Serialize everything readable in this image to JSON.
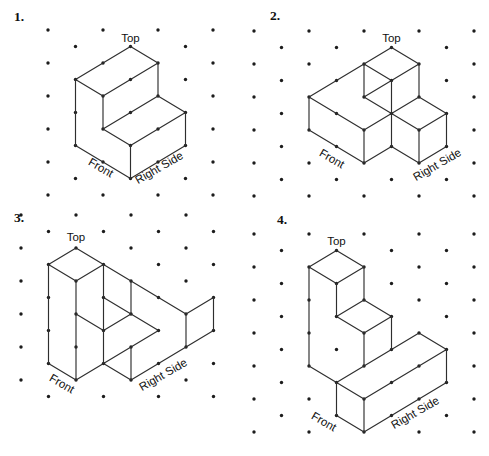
{
  "canvas": {
    "width": 489,
    "height": 456,
    "background": "#ffffff"
  },
  "style": {
    "unit_x": 27.5,
    "unit_y": 16.5,
    "line_color": "#2e2e2e",
    "line_width": 1.15,
    "dot_color": "#1c1c1c",
    "dot_radius": 1.7,
    "label_color": "#111111",
    "label_font_size": 11.5,
    "number_font_size": 13.5
  },
  "figures": [
    {
      "number": "1.",
      "number_pos": [
        14,
        21
      ],
      "origin": [
        48,
        30
      ],
      "grid_cols": 6,
      "grid_rows": 10,
      "edges": [
        [
          1,
          3,
          3,
          1
        ],
        [
          3,
          1,
          4,
          2
        ],
        [
          4,
          2,
          2,
          4
        ],
        [
          2,
          4,
          1,
          3
        ],
        [
          4,
          2,
          4,
          4
        ],
        [
          2,
          4,
          2,
          6
        ],
        [
          1,
          3,
          1,
          7
        ],
        [
          4,
          4,
          2,
          6
        ],
        [
          4,
          4,
          5,
          5
        ],
        [
          2,
          6,
          3,
          7
        ],
        [
          3,
          7,
          5,
          5
        ],
        [
          5,
          5,
          5,
          7
        ],
        [
          3,
          7,
          3,
          9
        ],
        [
          5,
          7,
          3,
          9
        ],
        [
          3,
          9,
          1,
          7
        ]
      ],
      "labels": [
        {
          "name": "top",
          "text": "Top",
          "pos": [
            130.5,
            42
          ],
          "rotate": 0
        },
        {
          "name": "front",
          "text": "Front",
          "pos": [
            99,
            171
          ],
          "rotate": 30
        },
        {
          "name": "right-side",
          "text": "Right Side",
          "pos": [
            161,
            171
          ],
          "rotate": -30
        }
      ]
    },
    {
      "number": "2.",
      "number_pos": [
        270,
        20
      ],
      "origin": [
        254,
        31
      ],
      "grid_cols": 8,
      "grid_rows": 10,
      "edges": [
        [
          4,
          2,
          5,
          1
        ],
        [
          5,
          1,
          6,
          2
        ],
        [
          6,
          2,
          5,
          3
        ],
        [
          5,
          3,
          4,
          2
        ],
        [
          4,
          2,
          4,
          4
        ],
        [
          6,
          2,
          6,
          4
        ],
        [
          5,
          3,
          5,
          7
        ],
        [
          4,
          4,
          5,
          5
        ],
        [
          5,
          5,
          6,
          4
        ],
        [
          5,
          3,
          4,
          4
        ],
        [
          2,
          4,
          4,
          2
        ],
        [
          2,
          4,
          4,
          6
        ],
        [
          4,
          6,
          5,
          5
        ],
        [
          2,
          4,
          2,
          6
        ],
        [
          4,
          6,
          4,
          8
        ],
        [
          2,
          6,
          4,
          8
        ],
        [
          4,
          8,
          5,
          7
        ],
        [
          6,
          4,
          7,
          5
        ],
        [
          7,
          5,
          6,
          6
        ],
        [
          6,
          6,
          5,
          5
        ],
        [
          7,
          5,
          7,
          7
        ],
        [
          6,
          6,
          6,
          8
        ],
        [
          5,
          7,
          6,
          8
        ],
        [
          6,
          8,
          7,
          7
        ]
      ],
      "labels": [
        {
          "name": "top",
          "text": "Top",
          "pos": [
            391.5,
            42
          ],
          "rotate": 0
        },
        {
          "name": "front",
          "text": "Front",
          "pos": [
            330,
            162
          ],
          "rotate": 30
        },
        {
          "name": "right-side",
          "text": "Right Side",
          "pos": [
            439,
            168
          ],
          "rotate": -30
        }
      ]
    },
    {
      "number": "3.",
      "number_pos": [
        14,
        222
      ],
      "origin": [
        21,
        215
      ],
      "grid_cols": 7,
      "grid_rows": 11,
      "edges": [
        [
          1,
          3,
          2,
          2
        ],
        [
          2,
          2,
          3,
          3
        ],
        [
          3,
          3,
          2,
          4
        ],
        [
          2,
          4,
          1,
          3
        ],
        [
          3,
          3,
          6,
          6
        ],
        [
          1,
          3,
          1,
          9
        ],
        [
          2,
          4,
          2,
          10
        ],
        [
          3,
          3,
          3,
          9
        ],
        [
          2,
          6,
          3,
          7
        ],
        [
          3,
          5,
          5,
          7
        ],
        [
          3,
          7,
          4,
          6
        ],
        [
          4,
          4,
          4,
          6
        ],
        [
          2,
          10,
          5,
          7
        ],
        [
          4,
          8,
          4,
          10
        ],
        [
          1,
          9,
          2,
          10
        ],
        [
          3,
          9,
          4,
          10
        ],
        [
          4,
          10,
          6,
          8
        ],
        [
          6,
          6,
          6,
          8
        ],
        [
          6,
          6,
          7,
          5
        ],
        [
          7,
          5,
          7,
          7
        ],
        [
          6,
          8,
          7,
          7
        ]
      ],
      "labels": [
        {
          "name": "top",
          "text": "Top",
          "pos": [
            76,
            241
          ],
          "rotate": 0
        },
        {
          "name": "front",
          "text": "Front",
          "pos": [
            60,
            387
          ],
          "rotate": 30
        },
        {
          "name": "right-side",
          "text": "Right Side",
          "pos": [
            165,
            378
          ],
          "rotate": -30
        }
      ]
    },
    {
      "number": "4.",
      "number_pos": [
        277,
        224
      ],
      "origin": [
        254,
        234
      ],
      "grid_cols": 8,
      "grid_rows": 12,
      "edges": [
        [
          2,
          2,
          3,
          1
        ],
        [
          3,
          1,
          4,
          2
        ],
        [
          4,
          2,
          3,
          3
        ],
        [
          3,
          3,
          2,
          2
        ],
        [
          2,
          2,
          2,
          8
        ],
        [
          3,
          3,
          3,
          5
        ],
        [
          4,
          2,
          4,
          4
        ],
        [
          3,
          5,
          4,
          4
        ],
        [
          4,
          4,
          5,
          5
        ],
        [
          5,
          5,
          4,
          6
        ],
        [
          4,
          6,
          3,
          5
        ],
        [
          4,
          6,
          4,
          8
        ],
        [
          5,
          5,
          5,
          7
        ],
        [
          3,
          9,
          6,
          6
        ],
        [
          6,
          6,
          7,
          7
        ],
        [
          4,
          10,
          7,
          7
        ],
        [
          2,
          8,
          4,
          10
        ],
        [
          3,
          9,
          3,
          11
        ],
        [
          4,
          10,
          4,
          12
        ],
        [
          7,
          7,
          7,
          9
        ],
        [
          3,
          11,
          4,
          12
        ],
        [
          4,
          12,
          7,
          9
        ]
      ],
      "labels": [
        {
          "name": "top",
          "text": "Top",
          "pos": [
            336.5,
            245
          ],
          "rotate": 0
        },
        {
          "name": "front",
          "text": "Front",
          "pos": [
            322,
            425
          ],
          "rotate": 30
        },
        {
          "name": "right-side",
          "text": "Right Side",
          "pos": [
            417,
            416
          ],
          "rotate": -30
        }
      ]
    }
  ]
}
